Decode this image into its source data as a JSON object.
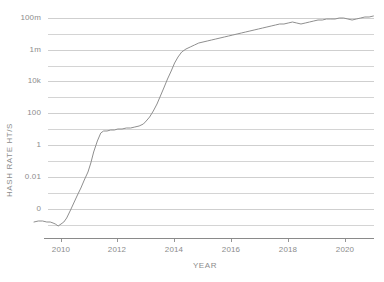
{
  "chart_data": {
    "type": "line",
    "title": "",
    "xlabel": "YEAR",
    "ylabel": "HASH RATE HT/S",
    "yscale": "log",
    "ylim": [
      0,
      100000000
    ],
    "xlim": [
      2009.0,
      2021.0
    ],
    "grid": true,
    "legend": false,
    "ytick_labels": [
      "100m",
      "1m",
      "10k",
      "100",
      "1",
      "0.01",
      "0"
    ],
    "ytick_values": [
      100000000,
      1000000,
      10000,
      100,
      1,
      0.01,
      0
    ],
    "xtick_labels": [
      "2010",
      "2012",
      "2014",
      "2016",
      "2018",
      "2020"
    ],
    "xtick_values": [
      2010,
      2012,
      2014,
      2016,
      2018,
      2020
    ],
    "minor_gridlines": true,
    "series": [
      {
        "name": "Hash Rate",
        "color": "#8f8f8f",
        "x": [
          2009.05,
          2009.2,
          2009.35,
          2009.5,
          2009.62,
          2009.72,
          2009.8,
          2009.9,
          2010.0,
          2010.1,
          2010.2,
          2010.32,
          2010.45,
          2010.58,
          2010.7,
          2010.82,
          2010.95,
          2011.05,
          2011.15,
          2011.28,
          2011.4,
          2011.5,
          2011.62,
          2011.75,
          2011.88,
          2012.0,
          2012.15,
          2012.3,
          2012.45,
          2012.6,
          2012.75,
          2012.9,
          2013.0,
          2013.12,
          2013.25,
          2013.38,
          2013.5,
          2013.62,
          2013.75,
          2013.88,
          2014.0,
          2014.12,
          2014.25,
          2014.4,
          2014.55,
          2014.7,
          2014.85,
          2015.0,
          2015.15,
          2015.3,
          2015.45,
          2015.6,
          2015.75,
          2015.9,
          2016.05,
          2016.2,
          2016.35,
          2016.5,
          2016.65,
          2016.8,
          2016.95,
          2017.1,
          2017.25,
          2017.4,
          2017.55,
          2017.7,
          2017.85,
          2018.0,
          2018.15,
          2018.3,
          2018.45,
          2018.6,
          2018.75,
          2018.9,
          2019.05,
          2019.2,
          2019.35,
          2019.5,
          2019.65,
          2019.8,
          2019.95,
          2020.1,
          2020.25,
          2020.4,
          2020.55,
          2020.7,
          2020.85,
          2021.0
        ],
        "y_pixel": [
          222,
          221,
          221,
          222,
          222,
          223,
          224,
          226,
          224,
          222,
          218,
          211,
          203,
          195,
          188,
          180,
          172,
          163,
          152,
          141,
          133,
          131,
          131,
          130,
          130,
          129,
          129,
          128,
          128,
          127,
          126,
          124,
          121,
          117,
          111,
          104,
          96,
          88,
          79,
          71,
          63,
          57,
          52,
          49,
          47,
          45,
          43,
          42,
          41,
          40,
          39,
          38,
          37,
          36,
          35,
          34,
          33,
          32,
          31,
          30,
          29,
          28,
          27,
          26,
          25,
          24,
          24,
          23,
          22,
          23,
          24,
          23,
          22,
          21,
          20,
          20,
          19,
          19,
          19,
          18,
          18,
          19,
          20,
          19,
          18,
          17,
          17,
          16
        ]
      }
    ]
  },
  "axis": {
    "y_title": "HASH RATE HT/S",
    "x_title": "YEAR"
  },
  "colors": {
    "line": "#8f8f8f",
    "grid": "#c9c9c9",
    "axis": "#8a8a8a",
    "text": "#8c8c8c",
    "background": "#ffffff"
  },
  "geometry": {
    "plot_left": 48,
    "plot_right": 374,
    "plot_top": 18,
    "plot_bottom": 238,
    "gridline_y": [
      18,
      34,
      50,
      66,
      81,
      97,
      113,
      129,
      145,
      161,
      177,
      193,
      209,
      225
    ],
    "label_gridline_y": [
      18,
      50,
      81,
      113,
      145,
      177,
      209
    ],
    "xtick_x": [
      61,
      117,
      174,
      231,
      288,
      345
    ],
    "x_origin": 2009.0,
    "px_per_year": 28.4
  }
}
